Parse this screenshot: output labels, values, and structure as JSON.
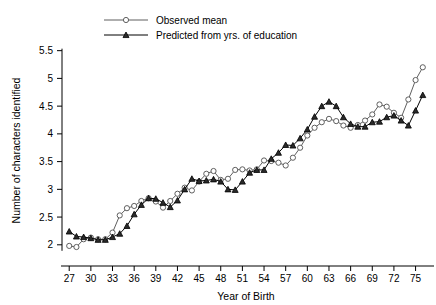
{
  "chart_data": {
    "type": "line",
    "title": "",
    "xlabel": "Year of Birth",
    "ylabel": "Number of characters identified",
    "xlim": [
      26,
      77
    ],
    "ylim": [
      1.78,
      5.62
    ],
    "grid": false,
    "legend_position": "top-left",
    "xticks": [
      27,
      30,
      33,
      36,
      39,
      42,
      45,
      48,
      51,
      54,
      57,
      60,
      63,
      66,
      69,
      72,
      75
    ],
    "xticklabels": [
      "27",
      "30",
      "33",
      "36",
      "39",
      "42",
      "45",
      "48",
      "51",
      "54",
      "57",
      "60",
      "63",
      "66",
      "69",
      "72",
      "75"
    ],
    "yticks": [
      2,
      2.5,
      3,
      3.5,
      4,
      4.5,
      5,
      5.5
    ],
    "yticklabels": [
      "2",
      "2.5",
      "3",
      "3.5",
      "4",
      "4.5",
      "5",
      "5.5"
    ],
    "x": [
      27,
      28,
      29,
      30,
      31,
      32,
      33,
      34,
      35,
      36,
      37,
      38,
      39,
      40,
      41,
      42,
      43,
      44,
      45,
      46,
      47,
      48,
      49,
      50,
      51,
      52,
      53,
      54,
      55,
      56,
      57,
      58,
      59,
      60,
      61,
      62,
      63,
      64,
      65,
      66,
      67,
      68,
      69,
      70,
      71,
      72,
      73,
      74,
      75,
      76
    ],
    "series": [
      {
        "name": "Observed mean",
        "marker": "circle-open",
        "color": "#5f5f5f",
        "values": [
          1.98,
          1.96,
          2.1,
          2.13,
          2.1,
          2.1,
          2.22,
          2.53,
          2.66,
          2.7,
          2.79,
          2.84,
          2.78,
          2.67,
          2.79,
          2.92,
          3.03,
          2.98,
          3.14,
          3.28,
          3.33,
          3.17,
          3.19,
          3.35,
          3.36,
          3.34,
          3.36,
          3.52,
          3.51,
          3.48,
          3.43,
          3.57,
          3.75,
          3.97,
          4.11,
          4.21,
          4.27,
          4.23,
          4.15,
          4.11,
          4.16,
          4.24,
          4.35,
          4.53,
          4.49,
          4.38,
          4.29,
          4.62,
          4.97,
          5.2
        ]
      },
      {
        "name": "Predicted from yrs. of education",
        "marker": "triangle-filled",
        "color": "#000000",
        "values": [
          2.24,
          2.15,
          2.14,
          2.12,
          2.09,
          2.09,
          2.14,
          2.2,
          2.34,
          2.55,
          2.72,
          2.84,
          2.83,
          2.76,
          2.68,
          2.8,
          3.0,
          3.19,
          3.15,
          3.16,
          3.18,
          3.14,
          3.0,
          2.99,
          3.14,
          3.3,
          3.35,
          3.35,
          3.55,
          3.66,
          3.8,
          3.79,
          3.92,
          4.08,
          4.31,
          4.5,
          4.58,
          4.5,
          4.3,
          4.18,
          4.13,
          4.13,
          4.21,
          4.22,
          4.3,
          4.33,
          4.24,
          4.15,
          4.42,
          4.7
        ]
      }
    ],
    "legend": [
      {
        "label": "Observed mean",
        "marker": "circle-open",
        "color": "#5f5f5f"
      },
      {
        "label": "Predicted from yrs. of education",
        "marker": "triangle-filled",
        "color": "#000000"
      }
    ]
  }
}
